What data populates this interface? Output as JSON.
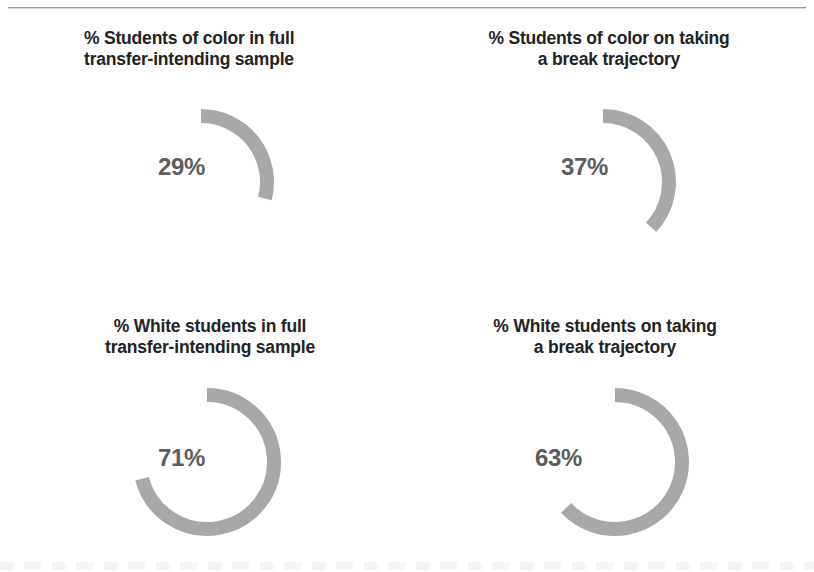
{
  "figure": {
    "background_color": "#ffffff",
    "arc_color": "#a8a8a8",
    "value_color": "#5d5d5d",
    "title_color": "#232323",
    "rule_color": "#9a9a9a"
  },
  "chart_data": {
    "type": "pie",
    "title": "",
    "subtitle": "",
    "xlabel": "",
    "ylabel": "",
    "legend": [],
    "grid": false,
    "units": "percent",
    "note": "Four donut/arc gauges arranged in a 2x2 grid. Each arc begins at 12 o'clock and sweeps clockwise by (value/100) x 360 degrees.",
    "categories": [
      "% Students of color in full transfer-intending sample",
      "% Students of color on taking a break trajectory",
      "% White students in full transfer-intending sample",
      "% White students on taking a break trajectory"
    ],
    "values": [
      29,
      37,
      71,
      63
    ],
    "series": [
      {
        "name": "Share of group",
        "values": [
          29,
          37,
          71,
          63
        ]
      }
    ],
    "gauges": [
      {
        "id": "students-of-color-full-sample",
        "title_line1": "% Students of color in full",
        "title_line2": "transfer-intending sample",
        "title_full": "% Students of color in full transfer-intending sample",
        "value": 29,
        "value_label": "29%",
        "sweep_degrees": 104.4,
        "start_degrees": 0,
        "align": "left"
      },
      {
        "id": "students-of-color-taking-a-break",
        "title_line1": "% Students of color on taking",
        "title_line2": "a break trajectory",
        "title_full": "% Students of color on taking a break trajectory",
        "value": 37,
        "value_label": "37%",
        "sweep_degrees": 133.2,
        "start_degrees": 0,
        "align": "center"
      },
      {
        "id": "white-students-full-sample",
        "title_line1": "% White students in full",
        "title_line2": "transfer-intending sample",
        "title_full": "% White students in full transfer-intending sample",
        "value": 71,
        "value_label": "71%",
        "sweep_degrees": 255.6,
        "start_degrees": 0,
        "align": "center"
      },
      {
        "id": "white-students-taking-a-break",
        "title_line1": "% White students on taking",
        "title_line2": "a break trajectory",
        "title_full": "% White students on taking a break trajectory",
        "value": 63,
        "value_label": "63%",
        "sweep_degrees": 226.8,
        "start_degrees": 0,
        "align": "center"
      }
    ]
  },
  "panels": {
    "top_left": {
      "title": "% Students of color in full\ntransfer-intending sample",
      "value_label": "29%"
    },
    "top_right": {
      "title": "% Students of color on taking\na break trajectory",
      "value_label": "37%"
    },
    "bottom_left": {
      "title": "% White students in full\ntransfer-intending sample",
      "value_label": "71%"
    },
    "bottom_right": {
      "title": "% White students on taking\na break trajectory",
      "value_label": "63%"
    }
  }
}
